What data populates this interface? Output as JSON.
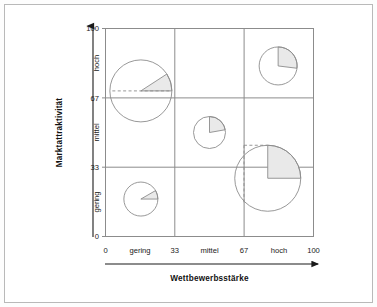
{
  "figure": {
    "type": "portfolio-matrix",
    "frame_color": "#b9b9b9",
    "grid_color": "#8c8c8c",
    "bubble_stroke": "#8c8c8c",
    "wedge_fill": "#e9e9e9",
    "background": "#ffffff"
  },
  "axes": {
    "x": {
      "label": "Wettbewerbsstärke",
      "numeric_ticks": [
        "0",
        "33",
        "67",
        "100"
      ],
      "category_ticks": [
        "gering",
        "mittel",
        "hoch"
      ],
      "range": [
        0,
        100
      ],
      "dividers": [
        33,
        67
      ]
    },
    "y": {
      "label": "Marktattraktivität",
      "numeric_ticks": [
        "0",
        "33",
        "67",
        "100"
      ],
      "category_ticks": [
        "gering",
        "mittel",
        "hoch"
      ],
      "range": [
        0,
        100
      ],
      "dividers": [
        33,
        67
      ]
    }
  },
  "chart_data": {
    "type": "scatter",
    "title": "",
    "subtitle": "",
    "xlabel": "Wettbewerbsstärke",
    "ylabel": "Marktattraktivität",
    "xlim": [
      0,
      100
    ],
    "ylim": [
      0,
      100
    ],
    "grid": true,
    "gridlines_x": [
      33,
      67
    ],
    "gridlines_y": [
      33,
      67
    ],
    "xtick_values": [
      0,
      33,
      67,
      100
    ],
    "xtick_labels": [
      "0",
      "33",
      "67",
      "100"
    ],
    "xcategory_labels": [
      "gering",
      "mittel",
      "hoch"
    ],
    "ytick_values": [
      0,
      33,
      67,
      100
    ],
    "ytick_labels": [
      "0",
      "33",
      "67",
      "100"
    ],
    "ycategory_labels": [
      "gering",
      "mittel",
      "hoch"
    ],
    "legend": [],
    "marker": "pie-bubble",
    "points": [
      {
        "id": "bubble-1",
        "x": 17,
        "y": 70,
        "radius_px": 31,
        "share_percent": 9,
        "wedge_start_deg": 0,
        "wedge_end_deg": 33,
        "guide_dashed_horizontal": true,
        "guide_dashed_vertical": false
      },
      {
        "id": "bubble-2",
        "x": 83,
        "y": 82,
        "radius_px": 19,
        "share_percent": 27,
        "wedge_start_deg": 90,
        "wedge_end_deg": -7,
        "guide_dashed_horizontal": false,
        "guide_dashed_vertical": false
      },
      {
        "id": "bubble-3",
        "x": 50,
        "y": 50,
        "radius_px": 16,
        "share_percent": 22,
        "wedge_start_deg": 90,
        "wedge_end_deg": 10,
        "guide_dashed_horizontal": false,
        "guide_dashed_vertical": false
      },
      {
        "id": "bubble-4",
        "x": 17,
        "y": 18,
        "radius_px": 17,
        "share_percent": 8,
        "wedge_start_deg": 0,
        "wedge_end_deg": 30,
        "guide_dashed_horizontal": false,
        "guide_dashed_vertical": false
      },
      {
        "id": "bubble-5",
        "x": 78,
        "y": 28,
        "radius_px": 33,
        "share_percent": 25,
        "wedge_start_deg": 90,
        "wedge_end_deg": 0,
        "guide_dashed_horizontal": true,
        "guide_dashed_vertical": true
      }
    ]
  }
}
